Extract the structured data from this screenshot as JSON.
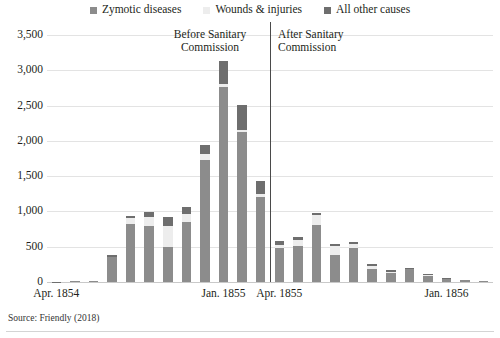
{
  "legend": {
    "items": [
      {
        "label": "Zymotic diseases",
        "color": "#8c8c8c",
        "name": "legend-zymotic"
      },
      {
        "label": "Wounds & injuries",
        "color": "#ededed",
        "name": "legend-wounds"
      },
      {
        "label": "All other causes",
        "color": "#6e6e6e",
        "name": "legend-other"
      }
    ]
  },
  "annotations": {
    "before": "Before Sanitary\nCommission",
    "after": "After Sanitary\nCommission",
    "divider_after_index": 11
  },
  "source": {
    "text": "Source: Friendly (2018)"
  },
  "chart_data": {
    "type": "bar",
    "stacked": true,
    "title": "",
    "subtitle": "",
    "xlabel": "",
    "ylabel": "",
    "ylim": [
      0,
      3500
    ],
    "ytick_step": 500,
    "ytick_labels": [
      "0",
      "500",
      "1,000",
      "1,500",
      "2,000",
      "2,500",
      "3,000",
      "3,500"
    ],
    "ytick_values": [
      0,
      500,
      1000,
      1500,
      2000,
      2500,
      3000,
      3500
    ],
    "grid": true,
    "grid_axis": "y",
    "legend_position": "top-center",
    "categories": [
      "Apr. 1854",
      "May 1854",
      "Jun. 1854",
      "Jul. 1854",
      "Aug. 1854",
      "Sep. 1854",
      "Oct. 1854",
      "Nov. 1854",
      "Dec. 1854",
      "Jan. 1855",
      "Feb. 1855",
      "Mar. 1855",
      "Apr. 1855",
      "May 1855",
      "Jun. 1855",
      "Jul. 1855",
      "Aug. 1855",
      "Sep. 1855",
      "Oct. 1855",
      "Nov. 1855",
      "Dec. 1855",
      "Jan. 1856",
      "Feb. 1856",
      "Mar. 1856"
    ],
    "xtick_labels": [
      "Apr. 1854",
      "Jan. 1855",
      "Apr. 1855",
      "Jan. 1856"
    ],
    "xtick_indices": [
      0,
      9,
      12,
      21
    ],
    "series": [
      {
        "name": "Zymotic diseases",
        "color": "#8c8c8c",
        "values": [
          1,
          12,
          11,
          359,
          828,
          788,
          503,
          844,
          1725,
          2761,
          2120,
          1205,
          477,
          508,
          802,
          382,
          483,
          189,
          128,
          178,
          91,
          42,
          24,
          15
        ]
      },
      {
        "name": "Wounds & injuries",
        "color": "#ededed",
        "values": [
          0,
          0,
          0,
          1,
          81,
          132,
          287,
          114,
          83,
          42,
          32,
          48,
          49,
          93,
          147,
          130,
          57,
          37,
          18,
          6,
          11,
          3,
          2,
          0
        ]
      },
      {
        "name": "All other causes",
        "color": "#6e6e6e",
        "values": [
          5,
          9,
          6,
          23,
          30,
          70,
          128,
          106,
          131,
          324,
          361,
          172,
          57,
          37,
          35,
          25,
          33,
          25,
          20,
          18,
          13,
          7,
          5,
          3
        ]
      }
    ]
  }
}
